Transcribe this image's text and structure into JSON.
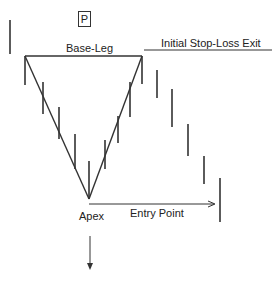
{
  "diagram": {
    "panel_label": "P",
    "labels": {
      "base_leg": "Base-Leg",
      "stop_loss": "Initial Stop-Loss Exit",
      "apex": "Apex",
      "entry_point": "Entry Point"
    },
    "colors": {
      "line": "#333333",
      "background": "#ffffff"
    },
    "price_bars": [
      {
        "x": 10,
        "high": 20,
        "low": 54
      },
      {
        "x": 25,
        "high": 56,
        "low": 85
      },
      {
        "x": 43,
        "high": 82,
        "low": 114
      },
      {
        "x": 59,
        "high": 107,
        "low": 139
      },
      {
        "x": 75,
        "high": 134,
        "low": 169
      },
      {
        "x": 89,
        "high": 161,
        "low": 199
      },
      {
        "x": 105,
        "high": 140,
        "low": 169
      },
      {
        "x": 118,
        "high": 116,
        "low": 143
      },
      {
        "x": 130,
        "high": 82,
        "low": 117
      },
      {
        "x": 142,
        "high": 56,
        "low": 84
      },
      {
        "x": 157,
        "high": 70,
        "low": 98
      },
      {
        "x": 172,
        "high": 89,
        "low": 127
      },
      {
        "x": 188,
        "high": 124,
        "low": 156
      },
      {
        "x": 204,
        "high": 156,
        "low": 184
      },
      {
        "x": 220,
        "high": 178,
        "low": 222
      }
    ]
  }
}
